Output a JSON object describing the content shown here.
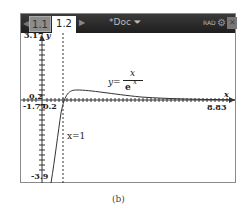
{
  "toolbar": {
    "tabs": [
      {
        "label": "1.1",
        "active": false
      },
      {
        "label": "1.2",
        "active": true
      }
    ],
    "doc_title": "*Doc",
    "angle_mode": "RAD"
  },
  "graph": {
    "y_max_label": "3.17",
    "y_axis_label": "y",
    "y_min_label": "-3.9",
    "x_min_label": "-1.77",
    "x_max_label": "8.83",
    "x_axis_label": "x",
    "tick_y_label": "0.2",
    "tick_x_label": "0.2",
    "function_lhs": "y=",
    "function_num": "x",
    "function_den": "e",
    "function_den_exp": "x",
    "vertical_line_label": "x=1"
  },
  "caption": "(b)"
}
